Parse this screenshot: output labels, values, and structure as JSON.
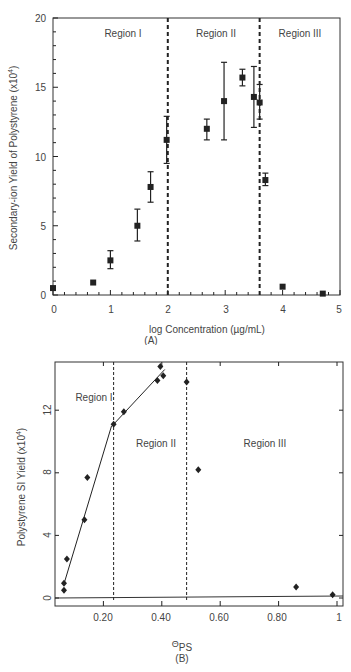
{
  "chart_data": [
    {
      "type": "scatter",
      "panel": "(A)",
      "title": "",
      "xlabel": "log Concentration (µg/mL)",
      "ylabel": "Secondary-ion Yield of Polystyrene (x10⁴)",
      "xlim": [
        0,
        5
      ],
      "ylim": [
        0,
        20
      ],
      "xticks": [
        0,
        1,
        2,
        3,
        4,
        5
      ],
      "yticks": [
        0,
        5,
        10,
        15,
        20
      ],
      "grid": false,
      "region_boundaries": [
        2.0,
        3.6
      ],
      "regions": [
        "Region I",
        "Region II",
        "Region III"
      ],
      "series": [
        {
          "name": "Polystyrene SI yield",
          "marker": "square",
          "x": [
            0.0,
            0.7,
            1.0,
            1.47,
            1.7,
            1.98,
            2.68,
            2.98,
            3.3,
            3.5,
            3.6,
            3.7,
            4.0,
            4.7
          ],
          "y": [
            0.5,
            0.9,
            2.5,
            5.0,
            7.8,
            11.2,
            12.0,
            14.0,
            15.7,
            14.3,
            13.9,
            8.3,
            0.6,
            0.1
          ],
          "y_low": [
            null,
            null,
            1.9,
            3.9,
            6.7,
            9.5,
            11.2,
            11.2,
            15.1,
            12.1,
            12.7,
            7.9,
            null,
            null
          ],
          "y_high": [
            null,
            null,
            3.2,
            6.2,
            8.9,
            12.9,
            12.7,
            16.8,
            16.3,
            16.5,
            15.2,
            8.8,
            null,
            null
          ]
        }
      ]
    },
    {
      "type": "scatter",
      "panel": "(B)",
      "title": "",
      "xlabel": "ΘPS",
      "ylabel": "Polystyrene SI Yield (x10⁴)",
      "xlim": [
        0.035,
        1.0
      ],
      "ylim": [
        -0.5,
        15.1
      ],
      "xticks": [
        0.2,
        0.4,
        0.6,
        0.8,
        1
      ],
      "xtick_labels": [
        "0.20",
        "0.40",
        "0.60",
        "0.80",
        "1"
      ],
      "yticks": [
        0,
        4,
        8,
        12
      ],
      "grid": false,
      "region_boundaries": [
        0.235,
        0.485
      ],
      "regions": [
        "Region I",
        "Region II",
        "Region III"
      ],
      "series": [
        {
          "name": "Polystyrene SI yield",
          "marker": "diamond",
          "x": [
            0.065,
            0.065,
            0.075,
            0.135,
            0.145,
            0.235,
            0.27,
            0.385,
            0.395,
            0.405,
            0.485,
            0.525,
            0.86,
            0.985
          ],
          "y": [
            0.5,
            0.95,
            2.5,
            5.0,
            7.7,
            11.1,
            11.9,
            13.9,
            14.8,
            14.2,
            13.8,
            8.2,
            0.7,
            0.2
          ]
        },
        {
          "name": "Region I fit",
          "type": "line",
          "x": [
            0.065,
            0.228
          ],
          "y": [
            0.9,
            11.0
          ]
        },
        {
          "name": "Region II fit",
          "type": "line",
          "x": [
            0.235,
            0.41
          ],
          "y": [
            11.1,
            14.6
          ]
        }
      ]
    }
  ],
  "labels": {
    "a": {
      "ylabel": "Secondary-ion Yield of Polystyrene (x10",
      "ylabel_sup": "4",
      "ylabel_end": ")",
      "xlabel": "log Concentration (µg/mL)",
      "panel": "(A)",
      "region1": "Region I",
      "region2": "Region II",
      "region3": "Region III",
      "yticks": [
        "0",
        "5",
        "10",
        "15",
        "20"
      ],
      "xticks": [
        "0",
        "1",
        "2",
        "3",
        "4",
        "5"
      ]
    },
    "b": {
      "ylabel": "Polystyrene SI Yield (x10",
      "ylabel_sup": "4",
      "ylabel_end": ")",
      "xlabel_main": "Θ",
      "xlabel_sub": "PS",
      "panel": "(B)",
      "region1": "Region I",
      "region2": "Region II",
      "region3": "Region III",
      "yticks": [
        "0",
        "4",
        "8",
        "12"
      ],
      "xticks": [
        "0.20",
        "0.40",
        "0.60",
        "0.80",
        "1"
      ]
    }
  },
  "colors": {
    "ink": "#222222",
    "text": "#444444",
    "background": "#ffffff"
  }
}
